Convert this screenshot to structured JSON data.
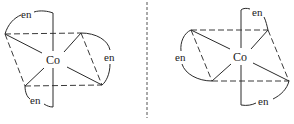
{
  "diagram": {
    "type": "octahedral-complex-isomers",
    "left_isomer": {
      "center_label": "Co",
      "ligand_labels": [
        "en",
        "en",
        "en"
      ],
      "ligand_positions": [
        "top",
        "right",
        "bottom"
      ]
    },
    "right_isomer": {
      "center_label": "Co",
      "ligand_labels": [
        "en",
        "en",
        "en"
      ],
      "ligand_positions": [
        "top",
        "left",
        "bottom"
      ]
    },
    "divider": "mirror-plane",
    "colors": {
      "line": "#2a2a2a",
      "text": "#1a1a1a",
      "background": "#ffffff"
    }
  }
}
